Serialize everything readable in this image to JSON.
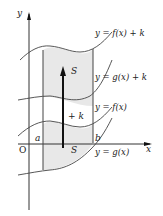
{
  "labels": {
    "y_axis": "y",
    "x_axis": "x",
    "origin": "O",
    "a": "a",
    "b": "b",
    "fk": "y = f(x) + k",
    "gk": "y = g(x) + k",
    "f": "y = f(x)",
    "g": "y = g(x)",
    "S_top": "S",
    "S_bottom": "S",
    "shift": "+ k"
  },
  "colors": {
    "shade": "#e8e8e8",
    "line": "#333333"
  }
}
